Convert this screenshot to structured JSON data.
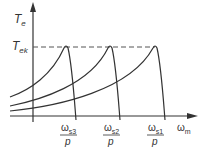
{
  "diagram": {
    "y_axis_label": "T",
    "y_axis_sub": "e",
    "peak_label": "T",
    "peak_sub": "ek",
    "x_axis_label": "ω",
    "x_axis_sub": "m",
    "ticks": [
      {
        "num": "ω",
        "sub": "s3",
        "den": "p"
      },
      {
        "num": "ω",
        "sub": "s2",
        "den": "p"
      },
      {
        "num": "ω",
        "sub": "s1",
        "den": "p"
      }
    ],
    "colors": {
      "line": "#333333",
      "dash": "#555555"
    }
  }
}
